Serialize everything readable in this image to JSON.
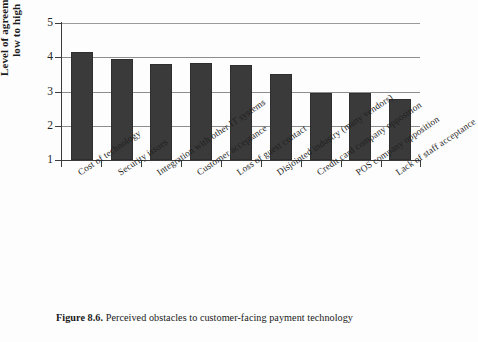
{
  "caption": {
    "number": "Figure 8.6.",
    "text": "Perceived obstacles to customer-facing payment technology"
  },
  "axes": {
    "y_title_line1": "Level of agreement",
    "y_title_line2": "low to high",
    "y_ticks": [
      "5",
      "4",
      "3",
      "2",
      "1"
    ]
  },
  "chart_data": {
    "type": "bar",
    "title": "Perceived obstacles to customer-facing payment technology",
    "xlabel": "",
    "ylabel": "Level of agreement low to high",
    "ylim": [
      1,
      5
    ],
    "yticks": [
      1,
      2,
      3,
      4,
      5
    ],
    "grid": true,
    "legend": "none",
    "bar_color": "#3a3a3a",
    "categories": [
      "Cost of technology",
      "Security issues",
      "Integration with other IT systems",
      "Customer acceptance",
      "Loss of guest contact",
      "Disjointed industry (many vendors)",
      "Credit card company opposition",
      "POS company opposition",
      "Lack of staff acceptance"
    ],
    "values": [
      4.15,
      3.95,
      3.8,
      3.82,
      3.78,
      3.5,
      2.95,
      2.96,
      2.77
    ]
  }
}
